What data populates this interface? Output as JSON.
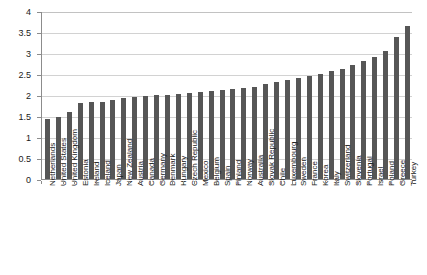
{
  "chart_data": {
    "type": "bar",
    "title": "",
    "subtitle": "",
    "xlabel": "",
    "ylabel": "",
    "ylim": [
      0,
      4
    ],
    "ytick_step": 0.5,
    "grid": true,
    "legend": false,
    "legend_position": "none",
    "bar_color": "#565656",
    "gridline_color": "#d2d2d2",
    "axis_color": "#8c8c8c",
    "background_color": "#ffffff",
    "ytick_labels": [
      "0",
      "0.5",
      "1",
      "1.5",
      "2",
      "2.5",
      "3",
      "3.5",
      "4"
    ],
    "ytick_values": [
      0,
      0.5,
      1,
      1.5,
      2,
      2.5,
      3,
      3.5,
      4
    ],
    "categories": [
      "Netherlands",
      "United States",
      "United Kingdom",
      "Estonia",
      "Ireland",
      "Iceland",
      "Japan",
      "New Zealand",
      "Austria",
      "Canada",
      "Germany",
      "Denmark",
      "Hungary",
      "Czech Republic",
      "Mexico",
      "Belgium",
      "Spain",
      "Finland",
      "Norway",
      "Australia",
      "Slovak Republic",
      "Chile",
      "Luxembourg",
      "Sweden",
      "France",
      "Korea",
      "Italy",
      "Switzerland",
      "Slovenia",
      "Portugal",
      "Israel",
      "Poland",
      "Greece",
      "Turkey"
    ],
    "values": [
      1.43,
      1.48,
      1.6,
      1.8,
      1.83,
      1.83,
      1.88,
      1.92,
      1.95,
      1.97,
      2.0,
      2.0,
      2.03,
      2.05,
      2.07,
      2.1,
      2.12,
      2.14,
      2.17,
      2.2,
      2.26,
      2.3,
      2.35,
      2.4,
      2.45,
      2.5,
      2.56,
      2.63,
      2.72,
      2.82,
      2.9,
      3.05,
      3.38,
      3.65
    ]
  }
}
